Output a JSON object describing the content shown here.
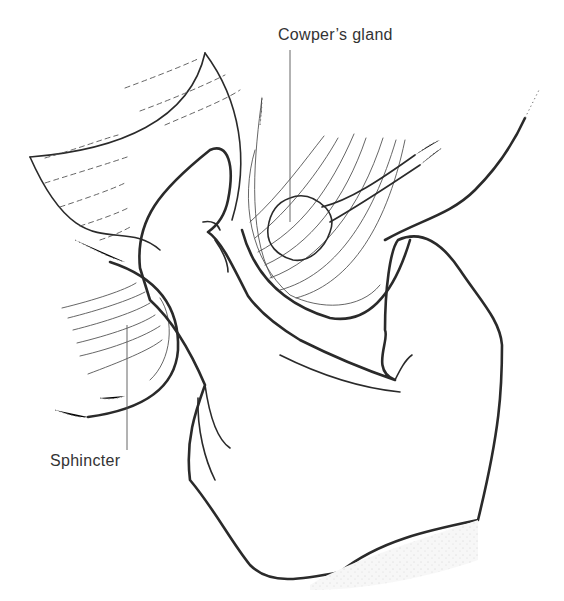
{
  "figure": {
    "labels": {
      "cowpers_gland": "Cowper’s gland",
      "sphincter": "Sphincter"
    },
    "colors": {
      "ink": "#2a2a2a",
      "stipple": "#b8b8b8",
      "background": "#ffffff",
      "label_text": "#333333"
    }
  }
}
